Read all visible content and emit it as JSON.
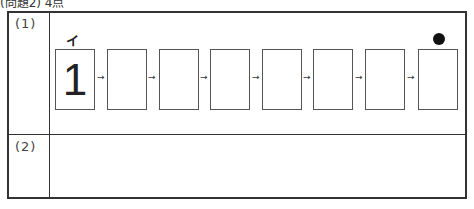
{
  "header": {
    "text": "(問題2) 4点"
  },
  "rows": [
    {
      "label": "(1)"
    },
    {
      "label": "(2)"
    }
  ],
  "sequence": {
    "start_mark": "イ",
    "end_mark": "●",
    "arrow": "→",
    "boxes": [
      "1",
      "",
      "",
      "",
      "",
      "",
      "",
      ""
    ]
  }
}
